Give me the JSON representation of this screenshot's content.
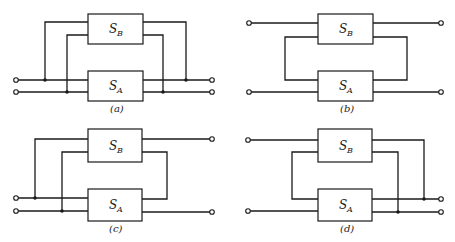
{
  "figure": {
    "panels": [
      {
        "id": "a",
        "caption": "(a)",
        "top_box": {
          "symbol": "S",
          "subscript": "B"
        },
        "bottom_box": {
          "symbol": "S",
          "subscript": "A"
        },
        "connection": "parallel-parallel: both boxes share both input and output ports"
      },
      {
        "id": "b",
        "caption": "(b)",
        "top_box": {
          "symbol": "S",
          "subscript": "B"
        },
        "bottom_box": {
          "symbol": "S",
          "subscript": "A"
        },
        "connection": "series-series: inner terminals of S_B and S_A joined by loop"
      },
      {
        "id": "c",
        "caption": "(c)",
        "top_box": {
          "symbol": "S",
          "subscript": "B"
        },
        "bottom_box": {
          "symbol": "S",
          "subscript": "A"
        },
        "connection": "parallel input, series output"
      },
      {
        "id": "d",
        "caption": "(d)",
        "top_box": {
          "symbol": "S",
          "subscript": "B"
        },
        "bottom_box": {
          "symbol": "S",
          "subscript": "A"
        },
        "connection": "series input, parallel output"
      }
    ]
  }
}
